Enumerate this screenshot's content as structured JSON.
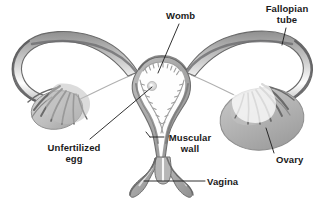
{
  "figure": {
    "style": "grayscale anatomical illustration on white background",
    "background_color": "#ffffff",
    "palette": {
      "outline_dark": "#4a4a4a",
      "outline_mid": "#6e6e6e",
      "muscle_gray": "#a8a8a8",
      "ovary_gray": "#b4b4b4",
      "lining_light": "#d6d6d6",
      "cavity_white": "#fdfdfd",
      "label_text": "#1a1a1a",
      "leader_line": "#1a1a1a"
    },
    "labels": [
      {
        "id": "womb",
        "lines": [
          "Womb"
        ],
        "text": "Womb",
        "x": 166,
        "y": 10,
        "leader": {
          "x1": 179,
          "y1": 24,
          "x2": 158,
          "y2": 73
        }
      },
      {
        "id": "fallopian-tube",
        "lines": [
          "Fallopian",
          "tube"
        ],
        "text": "Fallopian tube",
        "x": 262,
        "y": 3,
        "leader": {
          "x1": 286,
          "y1": 28,
          "x2": 282,
          "y2": 45
        }
      },
      {
        "id": "unfertilized-egg",
        "lines": [
          "Unfertilized",
          "egg"
        ],
        "text": "Unfertilized egg",
        "x": 44,
        "y": 142,
        "leader": {
          "x1": 90,
          "y1": 139,
          "x2": 152,
          "y2": 86
        }
      },
      {
        "id": "muscular-wall",
        "lines": [
          "Muscular",
          "wall"
        ],
        "text": "Muscular wall",
        "x": 166,
        "y": 132,
        "leader": {
          "x1": 164,
          "y1": 137,
          "x2": 150,
          "y2": 137
        }
      },
      {
        "id": "ovary",
        "lines": [
          "Ovary"
        ],
        "text": "Ovary",
        "x": 276,
        "y": 154,
        "leader": {
          "x1": 274,
          "y1": 153,
          "x2": 266,
          "y2": 128
        }
      },
      {
        "id": "vagina",
        "lines": [
          "Vagina"
        ],
        "text": "Vagina",
        "x": 207,
        "y": 176,
        "leader": {
          "x1": 205,
          "y1": 181,
          "x2": 144,
          "y2": 181
        }
      }
    ],
    "parts": [
      {
        "name": "left-fallopian-tube",
        "description": "long curved tube arcing from upper-left down to the uterus"
      },
      {
        "name": "right-fallopian-tube",
        "description": "long curved tube arcing from upper-right down to the uterus"
      },
      {
        "name": "left-fimbriae",
        "description": "finger-like projections at the end of the left tube"
      },
      {
        "name": "right-fimbriae",
        "description": "finger-like projections at the end of the right tube"
      },
      {
        "name": "left-ovary",
        "description": "small gray oval beneath the left fimbriae"
      },
      {
        "name": "right-ovary",
        "description": "large gray oval beneath the right fimbriae"
      },
      {
        "name": "uterus-cavity",
        "description": "white triangular cavity with textured endometrial lining"
      },
      {
        "name": "uterus-muscular-wall",
        "description": "thick gray myometrium surrounding the cavity"
      },
      {
        "name": "unfertilized-egg-dot",
        "description": "small pale dot inside the uterine cavity",
        "x": 152,
        "y": 86
      },
      {
        "name": "cervix",
        "description": "narrow neck below the uterus protruding into the vagina"
      },
      {
        "name": "vaginal-canal",
        "description": "canal below the cervix opening downward"
      }
    ]
  }
}
